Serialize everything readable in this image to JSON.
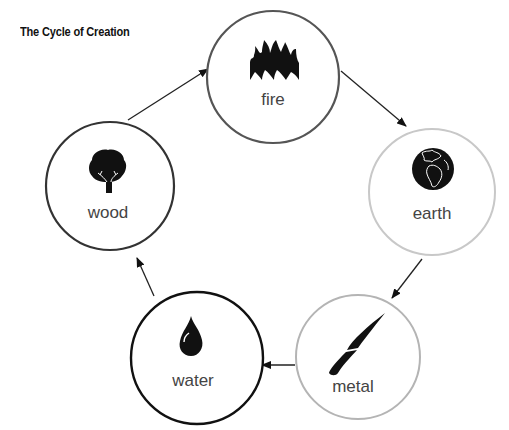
{
  "title": "The Cycle of Creation",
  "nodes": [
    {
      "id": "fire",
      "label": "fire",
      "icon": "flame-icon",
      "cx": 273,
      "cy": 77,
      "r": 66,
      "stroke": "#555555",
      "stroke_width": 2.2
    },
    {
      "id": "earth",
      "label": "earth",
      "icon": "globe-icon",
      "cx": 432,
      "cy": 192,
      "r": 63,
      "stroke": "#c8c8c8",
      "stroke_width": 2
    },
    {
      "id": "metal",
      "label": "metal",
      "icon": "knife-icon",
      "cx": 358,
      "cy": 357,
      "r": 62,
      "stroke": "#b4b4b4",
      "stroke_width": 2
    },
    {
      "id": "water",
      "label": "water",
      "icon": "water-drop-icon",
      "cx": 197,
      "cy": 358,
      "r": 66,
      "stroke": "#111111",
      "stroke_width": 2.4
    },
    {
      "id": "wood",
      "label": "wood",
      "icon": "tree-icon",
      "cx": 110,
      "cy": 186,
      "r": 64,
      "stroke": "#333333",
      "stroke_width": 2.2
    }
  ],
  "edges": [
    {
      "from": "wood",
      "to": "fire"
    },
    {
      "from": "fire",
      "to": "earth"
    },
    {
      "from": "earth",
      "to": "metal"
    },
    {
      "from": "metal",
      "to": "water"
    },
    {
      "from": "water",
      "to": "wood"
    }
  ]
}
